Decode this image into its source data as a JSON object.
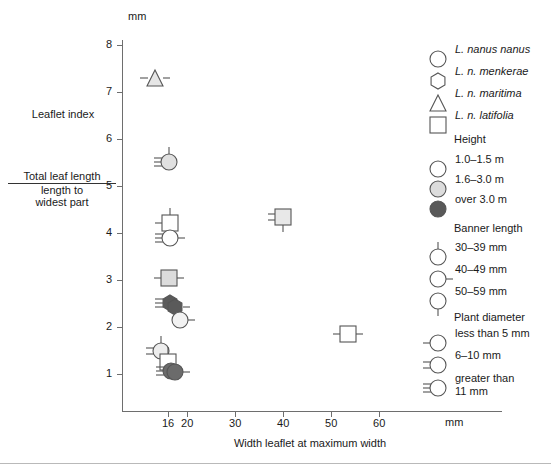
{
  "chart_data": {
    "type": "scatter",
    "title": "",
    "xlabel": "Width leaflet at maximum width",
    "xunit": "mm",
    "ylabel_main": "Leaflet index",
    "ylabel_numerator": "Total leaf length",
    "ylabel_denominator_line1": "length to",
    "ylabel_denominator_line2": "widest part",
    "yunit": "mm",
    "xticks": [
      16,
      20,
      30,
      40,
      50,
      60
    ],
    "xtick_labels": [
      "16",
      "20",
      "30",
      "40",
      "50",
      "60"
    ],
    "yticks": [
      1,
      2,
      3,
      4,
      5,
      6,
      7,
      8
    ],
    "ytick_labels": [
      "1",
      "2",
      "3",
      "4",
      "5",
      "6",
      "7",
      "8"
    ],
    "xlim": [
      13,
      66
    ],
    "ylim": [
      0.55,
      8.35
    ],
    "grid": false,
    "legend_position": "right",
    "points": [
      {
        "id": "p1",
        "x": 13.3,
        "y": 7.3,
        "shape": "triangle",
        "fill": "#e6e6e6",
        "banner": "right",
        "diameter": 1
      },
      {
        "id": "p2",
        "x": 16.3,
        "y": 5.52,
        "shape": "circle",
        "fill": "#e0e0e0",
        "banner": "top",
        "diameter": 3
      },
      {
        "id": "p3",
        "x": 16.4,
        "y": 4.22,
        "shape": "square",
        "fill": "#ffffff",
        "banner": "top",
        "diameter": 1
      },
      {
        "id": "p4",
        "x": 16.5,
        "y": 3.9,
        "shape": "circle",
        "fill": "#ffffff",
        "banner": "right",
        "diameter": 3
      },
      {
        "id": "p5",
        "x": 16.3,
        "y": 3.05,
        "shape": "square",
        "fill": "#dcdcdc",
        "banner": "right",
        "diameter": 1
      },
      {
        "id": "p6",
        "x": 16.4,
        "y": 2.52,
        "shape": "hexagon",
        "fill": "#5a5a5a",
        "banner": "none",
        "diameter": 3
      },
      {
        "id": "p7",
        "x": 17.4,
        "y": 2.42,
        "shape": "hexagon",
        "fill": "#5a5a5a",
        "banner": "right",
        "diameter": 0
      },
      {
        "id": "p8",
        "x": 18.4,
        "y": 2.15,
        "shape": "circle",
        "fill": "#f2f2f2",
        "banner": "right",
        "diameter": 0
      },
      {
        "id": "p9",
        "x": 14.6,
        "y": 1.5,
        "shape": "circle",
        "fill": "#ededed",
        "banner": "top",
        "diameter": 2
      },
      {
        "id": "p10",
        "x": 15.9,
        "y": 1.26,
        "shape": "square",
        "fill": "#ffffff",
        "banner": "top",
        "diameter": 0
      },
      {
        "id": "p11",
        "x": 16.7,
        "y": 1.06,
        "shape": "circle",
        "fill": "#6b6b6b",
        "banner": "none",
        "diameter": 3
      },
      {
        "id": "p12",
        "x": 17.5,
        "y": 1.05,
        "shape": "circle",
        "fill": "#6b6b6b",
        "banner": "right",
        "diameter": 0
      },
      {
        "id": "p13",
        "x": 39.9,
        "y": 4.33,
        "shape": "square",
        "fill": "#e8e8e8",
        "banner": "bottom",
        "diameter": 2
      },
      {
        "id": "p14",
        "x": 53.6,
        "y": 1.85,
        "shape": "square",
        "fill": "#ffffff",
        "banner": "right",
        "diameter": 1
      }
    ]
  },
  "legend": {
    "species": [
      {
        "label": "L. nanus nanus",
        "shape": "circle"
      },
      {
        "label": "L. n. menkerae",
        "shape": "hexagon"
      },
      {
        "label": "L. n. maritima",
        "shape": "triangle"
      },
      {
        "label": "L. n. latifolia",
        "shape": "square"
      }
    ],
    "height": {
      "title": "Height",
      "items": [
        {
          "label": "1.0–1.5 m",
          "fill": "#ffffff"
        },
        {
          "label": "1.6–3.0 m",
          "fill": "#dcdcdc"
        },
        {
          "label": "over 3.0 m",
          "fill": "#595959"
        }
      ]
    },
    "banner": {
      "title": "Banner length",
      "items": [
        {
          "label": "30–39 mm",
          "tick": "top"
        },
        {
          "label": "40–49 mm",
          "tick": "right"
        },
        {
          "label": "50–59 mm",
          "tick": "bottom"
        }
      ]
    },
    "diameter": {
      "title": "Plant diameter",
      "items": [
        {
          "label": "less than 5 mm",
          "lines": 1
        },
        {
          "label": "6–10 mm",
          "lines": 2
        },
        {
          "label": "greater than",
          "label2": "11 mm",
          "lines": 3
        }
      ]
    }
  },
  "colors": {
    "axis": "#6e6e6e",
    "stroke": "#555555",
    "text": "#1a1a1a",
    "rule": "#b9b9b9"
  }
}
